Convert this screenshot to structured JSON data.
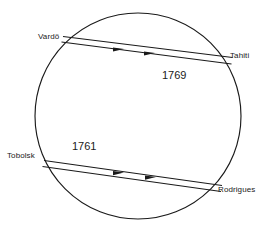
{
  "diagram": {
    "type": "transit-chord-diagram",
    "canvas": {
      "width": 273,
      "height": 231,
      "background": "#ffffff"
    },
    "stroke_color": "#1a1a1a",
    "disk": {
      "name": "solar-disk",
      "center_x": 138,
      "center_y": 116,
      "radius": 103
    },
    "labels": {
      "vardo": "Vardö",
      "tahiti": "Tahiti",
      "tobolsk": "Tobolsk",
      "rodrigues": "Rodrigues",
      "year_1769": "1769",
      "year_1761": "1761"
    },
    "transits": [
      {
        "year": "1769",
        "observers": [
          "Vardö",
          "Tahiti"
        ],
        "direction": "left-to-right",
        "chord_upper": {
          "x1": 63,
          "y1": 37,
          "x2": 232,
          "y2": 58
        },
        "chord_lower": {
          "x1": 62,
          "y1": 42,
          "x2": 231,
          "y2": 64
        },
        "arrow_count": 2
      },
      {
        "year": "1761",
        "observers": [
          "Tobolsk",
          "Rodrigues"
        ],
        "direction": "left-to-right",
        "chord_upper": {
          "x1": 44,
          "y1": 161,
          "x2": 222,
          "y2": 186
        },
        "chord_lower": {
          "x1": 43,
          "y1": 167,
          "x2": 221,
          "y2": 192
        },
        "arrow_count": 2
      }
    ]
  }
}
